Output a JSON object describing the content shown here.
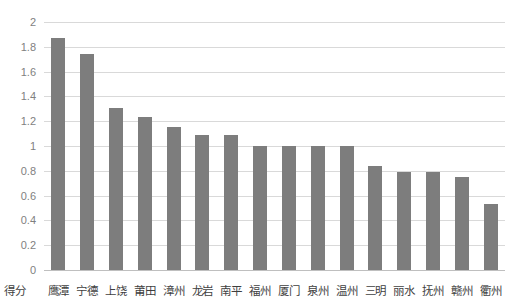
{
  "chart_data": {
    "type": "bar",
    "title": "",
    "subtitle": "",
    "xlabel": "",
    "ylabel": "",
    "axis_name_label": "得分",
    "categories": [
      "鹰潭",
      "宁德",
      "上饶",
      "莆田",
      "漳州",
      "龙岩",
      "南平",
      "福州",
      "厦门",
      "泉州",
      "温州",
      "三明",
      "丽水",
      "抚州",
      "赣州",
      "衢州"
    ],
    "values": [
      1.87,
      1.74,
      1.31,
      1.23,
      1.15,
      1.09,
      1.09,
      1.0,
      1.0,
      1.0,
      1.0,
      0.84,
      0.79,
      0.79,
      0.75,
      0.53
    ],
    "ylim": [
      0,
      2
    ],
    "ytick_step": 0.2,
    "ytick_labels": [
      "2",
      "1.8",
      "1.6",
      "1.4",
      "1.2",
      "1",
      "0.8",
      "0.6",
      "0.4",
      "0.2",
      "0"
    ],
    "ytick_values": [
      2,
      1.8,
      1.6,
      1.4,
      1.2,
      1,
      0.8,
      0.6,
      0.4,
      0.2,
      0
    ],
    "grid": true,
    "legend": false,
    "legend_position": "none",
    "series": [
      {
        "name": "得分",
        "values": [
          1.87,
          1.74,
          1.31,
          1.23,
          1.15,
          1.09,
          1.09,
          1.0,
          1.0,
          1.0,
          1.0,
          0.84,
          0.79,
          0.79,
          0.75,
          0.53
        ]
      }
    ],
    "colors": {
      "bar": "#7d7d7d",
      "gridline": "#d9d9d9",
      "baseline": "#bfbfbf",
      "tick_label": "#7f7f7f",
      "category_label": "#3f3f3f",
      "background": "#ffffff"
    }
  }
}
